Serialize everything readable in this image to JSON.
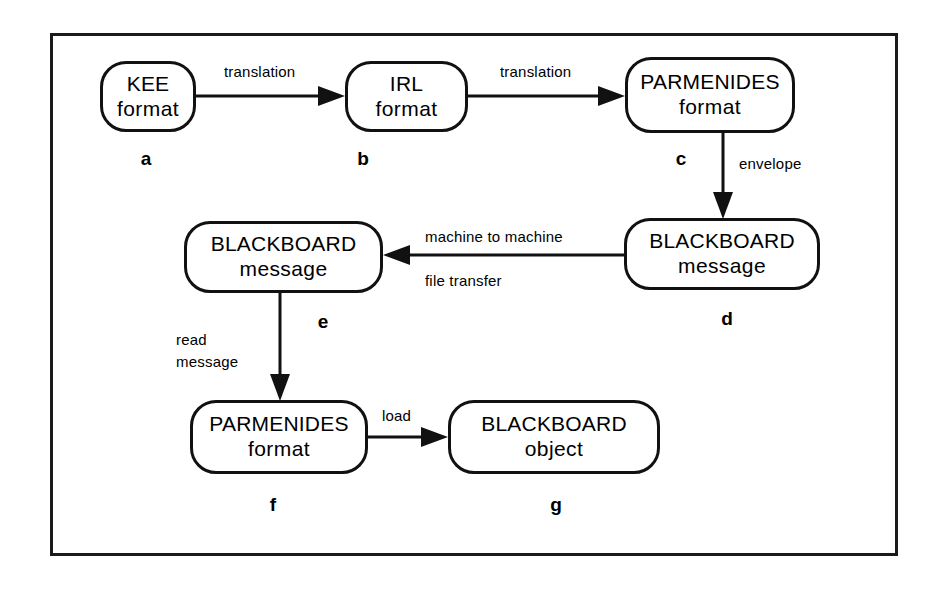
{
  "figure": {
    "background_color": "#ffffff",
    "line_color": "#111111"
  },
  "nodes": [
    {
      "id": "a",
      "line1": "KEE",
      "line2": "format",
      "caption": "a"
    },
    {
      "id": "b",
      "line1": "IRL",
      "line2": "format",
      "caption": "b"
    },
    {
      "id": "c",
      "line1": "PARMENIDES",
      "line2": "format",
      "caption": "c"
    },
    {
      "id": "d",
      "line1": "BLACKBOARD",
      "line2": "message",
      "caption": "d"
    },
    {
      "id": "e",
      "line1": "BLACKBOARD",
      "line2": "message",
      "caption": "e"
    },
    {
      "id": "f",
      "line1": "PARMENIDES",
      "line2": "format",
      "caption": "f"
    },
    {
      "id": "g",
      "line1": "BLACKBOARD",
      "line2": "object",
      "caption": "g"
    }
  ],
  "edges": [
    {
      "id": "a-b",
      "from": "a",
      "to": "b",
      "label": "translation"
    },
    {
      "id": "b-c",
      "from": "b",
      "to": "c",
      "label": "translation"
    },
    {
      "id": "c-d",
      "from": "c",
      "to": "d",
      "label": "envelope"
    },
    {
      "id": "d-e",
      "from": "d",
      "to": "e",
      "label_top": "machine to machine",
      "label_bottom": "file   transfer"
    },
    {
      "id": "e-f",
      "from": "e",
      "to": "f",
      "label_line1": "read",
      "label_line2": "message"
    },
    {
      "id": "f-g",
      "from": "f",
      "to": "g",
      "label": "load"
    }
  ]
}
